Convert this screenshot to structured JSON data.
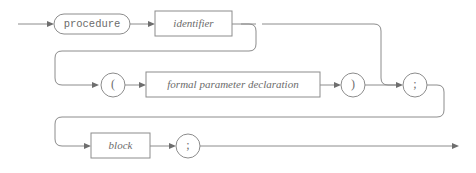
{
  "diagram": {
    "kind": "railroad-syntax-diagram",
    "rule_name": "procedure declaration",
    "colors": {
      "line": "#8c8c8c",
      "text": "#6b6b6b",
      "background": "#ffffff",
      "arrow": "#6e6e6e"
    },
    "nodes": {
      "procedure_keyword": {
        "label": "procedure",
        "shape": "stadium",
        "kind": "terminal"
      },
      "identifier": {
        "label": "identifier",
        "shape": "rect",
        "kind": "nonterminal"
      },
      "open_paren": {
        "label": "(",
        "shape": "circle",
        "kind": "terminal"
      },
      "formal_parameter_declaration": {
        "label": "formal parameter declaration",
        "shape": "rect",
        "kind": "nonterminal"
      },
      "close_paren": {
        "label": ")",
        "shape": "circle",
        "kind": "terminal"
      },
      "semicolon_header": {
        "label": ";",
        "shape": "circle",
        "kind": "terminal"
      },
      "block": {
        "label": "block",
        "shape": "rect",
        "kind": "nonterminal"
      },
      "semicolon_tail": {
        "label": ";",
        "shape": "circle",
        "kind": "terminal"
      }
    },
    "rows": [
      {
        "row": 1,
        "sequence": [
          "procedure_keyword",
          "identifier"
        ]
      },
      {
        "row": 2,
        "sequence": [
          "open_paren",
          "formal_parameter_declaration",
          "close_paren",
          "semicolon_header"
        ],
        "optional": true
      },
      {
        "row": 3,
        "sequence": [
          "block",
          "semicolon_tail"
        ]
      }
    ]
  }
}
